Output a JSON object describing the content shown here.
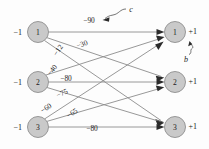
{
  "diagram": {
    "type": "bipartite-network",
    "title": "",
    "left_nodes": [
      {
        "id": "L1",
        "label": "1",
        "input_label": "−1",
        "cx": 38,
        "cy": 32,
        "r": 10.5
      },
      {
        "id": "L2",
        "label": "2",
        "input_label": "−1",
        "cx": 38,
        "cy": 82,
        "r": 10.5
      },
      {
        "id": "L3",
        "label": "3",
        "input_label": "−1",
        "cx": 38,
        "cy": 127,
        "r": 10.5
      }
    ],
    "right_nodes": [
      {
        "id": "R1",
        "label": "1",
        "output_label": "+1",
        "cx": 175,
        "cy": 32,
        "r": 10.5
      },
      {
        "id": "R2",
        "label": "2",
        "output_label": "+1",
        "cx": 175,
        "cy": 82,
        "r": 10.5
      },
      {
        "id": "R3",
        "label": "3",
        "output_label": "+1",
        "cx": 175,
        "cy": 127,
        "r": 10.5
      }
    ],
    "edges": [
      {
        "from": "L1",
        "to": "R1",
        "weight": "−90",
        "label_x": 89,
        "label_y": 20,
        "rotate": 0
      },
      {
        "from": "L1",
        "to": "R2",
        "weight": "−30",
        "label_x": 82,
        "label_y": 44,
        "rotate": -20
      },
      {
        "from": "L1",
        "to": "R3",
        "weight": "−12",
        "label_x": 58,
        "label_y": 50,
        "rotate": -55
      },
      {
        "from": "L2",
        "to": "R1",
        "weight": "−40",
        "label_x": 52,
        "label_y": 70,
        "rotate": -52
      },
      {
        "from": "L2",
        "to": "R2",
        "weight": "−80",
        "label_x": 66,
        "label_y": 78,
        "rotate": 0
      },
      {
        "from": "L2",
        "to": "R3",
        "weight": "−75",
        "label_x": 62,
        "label_y": 93,
        "rotate": -25
      },
      {
        "from": "L3",
        "to": "R1",
        "weight": "−60",
        "label_x": 46,
        "label_y": 108,
        "rotate": -33
      },
      {
        "from": "L3",
        "to": "R2",
        "weight": "−65",
        "label_x": 72,
        "label_y": 113,
        "rotate": -33
      },
      {
        "from": "L3",
        "to": "R3",
        "weight": "−80",
        "label_x": 92,
        "label_y": 128,
        "rotate": 0
      }
    ],
    "annotations": [
      {
        "id": "c-annotation",
        "text": "c",
        "x": 131,
        "y": 9
      },
      {
        "id": "b-annotation",
        "text": "b",
        "x": 188,
        "y": 59
      }
    ]
  },
  "colors": {
    "node_fill": "#c9c9c9",
    "node_stroke": "#8f8f8f",
    "edge_stroke": "#8c8c8c",
    "arrow_fill": "#2b2b2b",
    "text": "#1a1a1a",
    "background": "#fdfdfd"
  }
}
